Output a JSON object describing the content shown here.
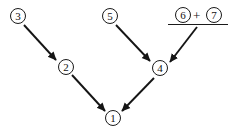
{
  "diagram": {
    "background_color": "#ffffff",
    "ink_color": "#1a1a1a",
    "nodes": [
      {
        "id": "n1",
        "label": "1",
        "x": 105,
        "y": 110
      },
      {
        "id": "n2",
        "label": "2",
        "x": 58,
        "y": 59
      },
      {
        "id": "n3",
        "label": "3",
        "x": 10,
        "y": 8
      },
      {
        "id": "n4",
        "label": "4",
        "x": 152,
        "y": 60
      },
      {
        "id": "n5",
        "label": "5",
        "x": 102,
        "y": 8
      },
      {
        "id": "n6",
        "label": "6",
        "x": 175,
        "y": 7
      },
      {
        "id": "n7",
        "label": "7",
        "x": 206,
        "y": 7
      }
    ],
    "operator": {
      "label": "+",
      "x": 193,
      "y": 9
    },
    "rule": {
      "x": 168,
      "y": 24,
      "width": 60,
      "height": 1
    },
    "edges": [
      {
        "from": "n3",
        "to": "n2",
        "x1": 24,
        "y1": 25,
        "x2": 56,
        "y2": 60
      },
      {
        "from": "n2",
        "to": "n1",
        "x1": 72,
        "y1": 75,
        "x2": 105,
        "y2": 111
      },
      {
        "from": "n5",
        "to": "n4",
        "x1": 116,
        "y1": 25,
        "x2": 150,
        "y2": 61
      },
      {
        "from": "rule",
        "to": "n4",
        "x1": 197,
        "y1": 27,
        "x2": 170,
        "y2": 62
      },
      {
        "from": "n4",
        "to": "n1",
        "x1": 154,
        "y1": 78,
        "x2": 122,
        "y2": 111
      }
    ]
  }
}
